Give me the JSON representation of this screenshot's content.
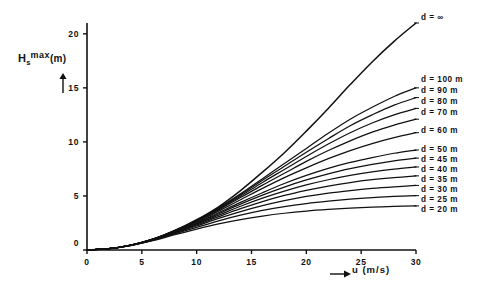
{
  "chart_data": {
    "type": "line",
    "title": "",
    "xlabel": "u (m/s)",
    "ylabel": "Hs max (m)",
    "xlim": [
      0,
      30
    ],
    "ylim": [
      0,
      21
    ],
    "xticks": [
      0,
      5,
      10,
      15,
      20,
      25,
      30
    ],
    "yticks": [
      0,
      5,
      10,
      15,
      20
    ],
    "grid": false,
    "legend_position": "right-inline-annotations",
    "x": [
      0,
      2,
      4,
      6,
      8,
      10,
      12,
      14,
      16,
      18,
      20,
      22,
      24,
      26,
      28,
      30
    ],
    "series": [
      {
        "name": "d = ∞",
        "depth": null,
        "label": "d = ∞",
        "values": [
          0.0,
          0.12,
          0.45,
          1.0,
          1.8,
          2.8,
          4.0,
          5.5,
          7.2,
          9.0,
          11.0,
          13.1,
          15.3,
          17.4,
          19.3,
          21.0
        ]
      },
      {
        "name": "d = 100 m",
        "depth": 100,
        "label": "d = 100 m",
        "values": [
          0.0,
          0.12,
          0.45,
          1.0,
          1.8,
          2.75,
          3.9,
          5.2,
          6.6,
          8.0,
          9.4,
          10.8,
          12.1,
          13.2,
          14.2,
          15.0
        ]
      },
      {
        "name": "d = 90 m",
        "depth": 90,
        "label": "d = 90 m",
        "values": [
          0.0,
          0.12,
          0.45,
          1.0,
          1.78,
          2.72,
          3.85,
          5.1,
          6.45,
          7.75,
          9.05,
          10.3,
          11.5,
          12.5,
          13.4,
          14.1
        ]
      },
      {
        "name": "d = 80 m",
        "depth": 80,
        "label": "d = 80 m",
        "values": [
          0.0,
          0.12,
          0.45,
          1.0,
          1.76,
          2.68,
          3.78,
          4.98,
          6.25,
          7.45,
          8.65,
          9.8,
          10.85,
          11.75,
          12.5,
          13.1
        ]
      },
      {
        "name": "d = 70 m",
        "depth": 70,
        "label": "d = 70 m",
        "values": [
          0.0,
          0.12,
          0.45,
          0.99,
          1.74,
          2.64,
          3.7,
          4.85,
          6.0,
          7.1,
          8.2,
          9.2,
          10.1,
          10.9,
          11.55,
          12.1
        ]
      },
      {
        "name": "d = 60 m",
        "depth": 60,
        "label": "d = 60 m",
        "values": [
          0.0,
          0.12,
          0.45,
          0.98,
          1.72,
          2.58,
          3.6,
          4.65,
          5.7,
          6.7,
          7.6,
          8.45,
          9.2,
          9.85,
          10.4,
          10.85
        ]
      },
      {
        "name": "d = 50 m",
        "depth": 50,
        "label": "d = 50 m",
        "values": [
          0.0,
          0.12,
          0.44,
          0.97,
          1.68,
          2.5,
          3.45,
          4.4,
          5.3,
          6.15,
          6.9,
          7.55,
          8.1,
          8.55,
          8.95,
          9.25
        ]
      },
      {
        "name": "d = 45 m",
        "depth": 45,
        "label": "d = 45 m",
        "values": [
          0.0,
          0.12,
          0.44,
          0.96,
          1.66,
          2.45,
          3.35,
          4.25,
          5.08,
          5.82,
          6.48,
          7.05,
          7.52,
          7.92,
          8.25,
          8.5
        ]
      },
      {
        "name": "d = 40 m",
        "depth": 40,
        "label": "d = 40 m",
        "values": [
          0.0,
          0.12,
          0.44,
          0.95,
          1.63,
          2.4,
          3.22,
          4.05,
          4.8,
          5.45,
          6.02,
          6.5,
          6.9,
          7.22,
          7.48,
          7.68
        ]
      },
      {
        "name": "d = 35 m",
        "depth": 35,
        "label": "d = 35 m",
        "values": [
          0.0,
          0.12,
          0.43,
          0.94,
          1.6,
          2.32,
          3.08,
          3.82,
          4.48,
          5.05,
          5.52,
          5.92,
          6.24,
          6.5,
          6.7,
          6.86
        ]
      },
      {
        "name": "d = 30 m",
        "depth": 30,
        "label": "d = 30 m",
        "values": [
          0.0,
          0.12,
          0.43,
          0.92,
          1.56,
          2.22,
          2.92,
          3.55,
          4.1,
          4.56,
          4.95,
          5.26,
          5.5,
          5.7,
          5.85,
          5.97
        ]
      },
      {
        "name": "d = 25 m",
        "depth": 25,
        "label": "d = 25 m",
        "values": [
          0.0,
          0.12,
          0.42,
          0.9,
          1.5,
          2.1,
          2.7,
          3.22,
          3.66,
          4.02,
          4.3,
          4.52,
          4.7,
          4.84,
          4.95,
          5.03
        ]
      },
      {
        "name": "d = 20 m",
        "depth": 20,
        "label": "d = 20 m",
        "values": [
          0.0,
          0.12,
          0.41,
          0.86,
          1.41,
          1.94,
          2.42,
          2.82,
          3.14,
          3.4,
          3.6,
          3.75,
          3.87,
          3.96,
          4.03,
          4.08
        ]
      }
    ]
  },
  "axes": {
    "y_label_symbol": "H",
    "y_label_subscript": "s",
    "y_label_superscript": "max",
    "y_label_unit": "(m)",
    "x_label": "u (m/s)",
    "x_tick_labels": [
      "0",
      "5",
      "10",
      "15",
      "20",
      "25",
      "30"
    ],
    "y_tick_labels": [
      "0",
      "5",
      "10",
      "15",
      "20"
    ],
    "origin_label": "0"
  },
  "legend": {
    "items": [
      {
        "label": "d = ∞"
      },
      {
        "label": "d = 100 m"
      },
      {
        "label": "d = 90 m"
      },
      {
        "label": "d = 80 m"
      },
      {
        "label": "d = 70 m"
      },
      {
        "label": "d = 60 m"
      },
      {
        "label": "d = 50 m"
      },
      {
        "label": "d = 45 m"
      },
      {
        "label": "d = 40 m"
      },
      {
        "label": "d = 35 m"
      },
      {
        "label": "d = 30 m"
      },
      {
        "label": "d = 25 m"
      },
      {
        "label": "d = 20 m"
      }
    ]
  },
  "colors": {
    "ink": "#111111",
    "background": "#ffffff"
  }
}
